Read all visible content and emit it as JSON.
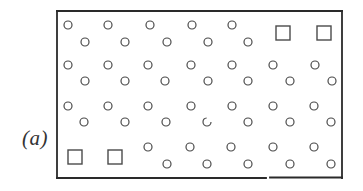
{
  "figure": {
    "label": "(a)",
    "frame": {
      "x": 57,
      "y": 11,
      "width": 285,
      "height": 167,
      "stroke": "#2a2a2a",
      "stroke_width": 1.8
    },
    "site_style": {
      "circle_radius": 4,
      "square_size": 14,
      "stroke": "#4a4a4a",
      "stroke_width": 1.2
    },
    "legend": {
      "circle": "occupied lattice site",
      "square": "vacant site"
    },
    "rows": [
      {
        "name": "row-1-upper",
        "y": 25,
        "sites": [
          {
            "x": 68,
            "type": "circle"
          },
          {
            "x": 108,
            "type": "circle"
          },
          {
            "x": 150,
            "type": "circle"
          },
          {
            "x": 192,
            "type": "circle"
          },
          {
            "x": 232,
            "type": "circle"
          },
          {
            "x": 283,
            "y": 33,
            "type": "square"
          },
          {
            "x": 324,
            "y": 33,
            "type": "square"
          }
        ]
      },
      {
        "name": "row-1-lower",
        "y": 42,
        "sites": [
          {
            "x": 85,
            "type": "circle"
          },
          {
            "x": 125,
            "type": "circle"
          },
          {
            "x": 167,
            "type": "circle"
          },
          {
            "x": 208,
            "type": "circle"
          },
          {
            "x": 248,
            "type": "circle"
          }
        ]
      },
      {
        "name": "row-2-upper",
        "y": 65,
        "sites": [
          {
            "x": 68,
            "type": "circle"
          },
          {
            "x": 108,
            "type": "circle"
          },
          {
            "x": 148,
            "type": "circle"
          },
          {
            "x": 191,
            "type": "circle"
          },
          {
            "x": 232,
            "type": "circle"
          },
          {
            "x": 273,
            "type": "circle"
          },
          {
            "x": 315,
            "type": "circle"
          }
        ]
      },
      {
        "name": "row-2-lower",
        "y": 81,
        "sites": [
          {
            "x": 85,
            "type": "circle"
          },
          {
            "x": 125,
            "type": "circle"
          },
          {
            "x": 165,
            "type": "circle"
          },
          {
            "x": 208,
            "type": "circle"
          },
          {
            "x": 248,
            "type": "circle"
          },
          {
            "x": 290,
            "type": "circle"
          },
          {
            "x": 332,
            "type": "circle"
          }
        ]
      },
      {
        "name": "row-3-upper",
        "y": 106,
        "sites": [
          {
            "x": 68,
            "type": "circle"
          },
          {
            "x": 108,
            "type": "circle"
          },
          {
            "x": 148,
            "type": "circle"
          },
          {
            "x": 191,
            "type": "circle"
          },
          {
            "x": 232,
            "type": "circle"
          },
          {
            "x": 273,
            "type": "circle"
          },
          {
            "x": 314,
            "type": "circle"
          }
        ]
      },
      {
        "name": "row-3-lower",
        "y": 122,
        "sites": [
          {
            "x": 84,
            "type": "circle"
          },
          {
            "x": 125,
            "type": "circle"
          },
          {
            "x": 166,
            "type": "circle"
          },
          {
            "x": 207,
            "type": "circle",
            "broken": true
          },
          {
            "x": 248,
            "type": "circle"
          },
          {
            "x": 290,
            "type": "circle"
          },
          {
            "x": 331,
            "type": "circle"
          }
        ]
      },
      {
        "name": "row-4-upper",
        "y": 147,
        "sites": [
          {
            "x": 75,
            "y": 157,
            "type": "square"
          },
          {
            "x": 115,
            "y": 157,
            "type": "square"
          },
          {
            "x": 148,
            "type": "circle"
          },
          {
            "x": 190,
            "type": "circle"
          },
          {
            "x": 231,
            "type": "circle"
          },
          {
            "x": 273,
            "type": "circle"
          },
          {
            "x": 314,
            "type": "circle"
          }
        ]
      },
      {
        "name": "row-4-lower",
        "y": 164,
        "sites": [
          {
            "x": 167,
            "type": "circle"
          },
          {
            "x": 207,
            "type": "circle"
          },
          {
            "x": 248,
            "type": "circle"
          },
          {
            "x": 290,
            "type": "circle"
          },
          {
            "x": 331,
            "type": "circle"
          }
        ]
      }
    ]
  }
}
